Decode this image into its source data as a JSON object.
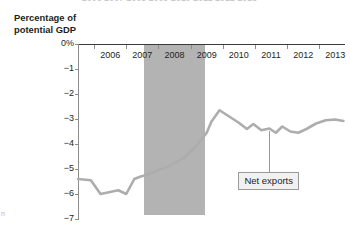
{
  "figure": {
    "cut_text_above": "2006   2007   2008   2009   2010   2011   2012   2013",
    "page_mark": "n"
  },
  "axes": {
    "y_title_line1": "Percentage of",
    "y_title_line2": "potential GDP",
    "y_ticks": [
      "0%",
      "−1",
      "−2",
      "−3",
      "−4",
      "−5",
      "−6",
      "−7"
    ],
    "x_ticks": [
      "2006",
      "2007",
      "2008",
      "2009",
      "2010",
      "2011",
      "2012",
      "2013"
    ]
  },
  "annotations": {
    "series_label": "Net exports",
    "recession_band_label": ""
  },
  "colors": {
    "line": "#adadad",
    "recession_band": "#b3b3b3",
    "zero_axis": "#3a3a3a",
    "axis": "#8c8c8c",
    "callout_fill": "#f1f1f1",
    "callout_border": "#9a9a9a",
    "text": "#231f20"
  },
  "chart_data": {
    "type": "line",
    "title": "",
    "xlabel": "",
    "ylabel": "Percentage of potential GDP",
    "xlim": [
      2005.5,
      2013.8
    ],
    "ylim": [
      -7,
      0
    ],
    "grid": false,
    "legend": "none",
    "series": [
      {
        "name": "Net exports",
        "x": [
          2005.5,
          2005.9,
          2006.2,
          2006.5,
          2006.75,
          2007.0,
          2007.25,
          2007.45,
          2007.6,
          2007.9,
          2008.3,
          2008.8,
          2009.2,
          2009.5,
          2009.65,
          2009.9,
          2010.2,
          2010.5,
          2010.75,
          2010.95,
          2011.2,
          2011.45,
          2011.65,
          2011.85,
          2012.1,
          2012.35,
          2012.6,
          2012.9,
          2013.2,
          2013.5,
          2013.75
        ],
        "values": [
          -5.4,
          -5.45,
          -6.0,
          -5.92,
          -5.85,
          -6.0,
          -5.4,
          -5.3,
          -5.25,
          -5.1,
          -4.9,
          -4.55,
          -4.05,
          -3.55,
          -3.1,
          -2.65,
          -2.9,
          -3.15,
          -3.4,
          -3.2,
          -3.45,
          -3.38,
          -3.55,
          -3.3,
          -3.5,
          -3.55,
          -3.4,
          -3.18,
          -3.05,
          -3.02,
          -3.08
        ]
      }
    ],
    "shaded_regions": [
      {
        "label": "Recession",
        "x_start": 2007.55,
        "x_end": 2009.45,
        "y_start": -6.85,
        "y_end": 0
      }
    ],
    "annotations": [
      {
        "text": "Net exports",
        "x": 2011.45,
        "y": -3.38,
        "label_y": -5.1
      }
    ]
  }
}
